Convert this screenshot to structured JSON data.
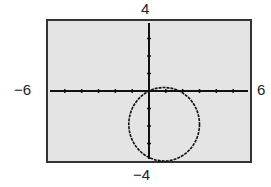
{
  "chart_data": {
    "type": "line",
    "title": "",
    "xlabel": "",
    "ylabel": "",
    "xlim": [
      -6,
      6
    ],
    "ylim": [
      -4,
      4
    ],
    "xscale": 1,
    "yscale": 1,
    "grid": false,
    "tick_labels": {
      "xmin": "−6",
      "xmax": "6",
      "ymin": "−4",
      "ymax": "4"
    },
    "series": [
      {
        "name": "circle",
        "shape": "circle",
        "center": [
          0.9,
          -1.9
        ],
        "radius": 2.1,
        "note": "passes approximately through origin"
      }
    ]
  },
  "colors": {
    "background": "#e4e4e4",
    "frame": "#333333",
    "curve": "#111111",
    "axis": "#111111"
  }
}
